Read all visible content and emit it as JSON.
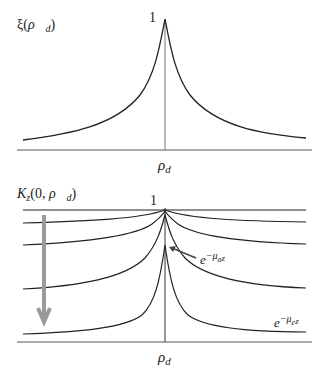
{
  "top_panel": {
    "y_label": {
      "main": "ξ(",
      "vec": "ρ⃗",
      "sub": "d",
      "close": ")"
    },
    "peak_label": "1",
    "x_label": {
      "main": "ρ",
      "sub": "d"
    },
    "curve": "symmetric cusp peaked at center, decaying toward baseline"
  },
  "bottom_panel": {
    "y_label": {
      "main": "K",
      "sub": "z",
      "args": "(0, ",
      "vec": "ρ⃗",
      "vsub": "d",
      "close": ")"
    },
    "peak_label": "1",
    "x_label": {
      "main": "ρ",
      "sub": "d"
    },
    "annotation_inner": {
      "base": "e",
      "exp": "−μ",
      "exp_sub": "a",
      "exp_tail": "z"
    },
    "annotation_outer": {
      "base": "e",
      "exp": "−μ",
      "exp_sub": "e",
      "exp_tail": "z"
    },
    "arrow_color": "#9a9a9a",
    "curve_count": 5,
    "curve_note": "curves descend with increasing z (gray arrow), tails approach e^{-μe z}"
  },
  "colors": {
    "line": "#222222",
    "axis": "#555555",
    "arrow": "#9a9a9a"
  }
}
